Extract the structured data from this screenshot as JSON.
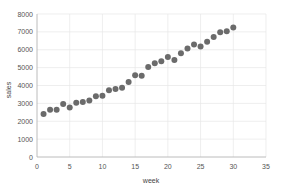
{
  "chart_data": {
    "type": "scatter",
    "title": "",
    "xlabel": "week",
    "ylabel": "sales",
    "xlim": [
      0,
      35
    ],
    "ylim": [
      0,
      8000
    ],
    "xticks": [
      0,
      5,
      10,
      15,
      20,
      25,
      30,
      35
    ],
    "yticks": [
      0,
      1000,
      2000,
      3000,
      4000,
      5000,
      6000,
      7000,
      8000
    ],
    "xtick_labels": [
      "0",
      "5",
      "10",
      "15",
      "20",
      "25",
      "30",
      "35"
    ],
    "ytick_labels": [
      "0",
      "1000",
      "2000",
      "3000",
      "4000",
      "5000",
      "6000",
      "7000",
      "8000"
    ],
    "grid": true,
    "grid_axis": "y",
    "legend": false,
    "marker_color": "#6b6b6b",
    "marker_size": 3.0,
    "background_color": "#ffffff",
    "x": [
      1,
      2,
      3,
      4,
      5,
      6,
      7,
      8,
      9,
      10,
      11,
      12,
      13,
      14,
      15,
      16,
      17,
      18,
      19,
      20,
      21,
      22,
      23,
      24,
      25,
      26,
      27,
      28,
      29,
      30
    ],
    "y": [
      2400,
      2650,
      2650,
      2960,
      2770,
      3030,
      3070,
      3160,
      3400,
      3430,
      3740,
      3800,
      3870,
      4200,
      4580,
      4550,
      5030,
      5250,
      5350,
      5600,
      5420,
      5800,
      6070,
      6300,
      6180,
      6450,
      6720,
      6980,
      7030,
      7250
    ],
    "series_name": "sales"
  },
  "axes": {
    "y_axis_title": "sales",
    "x_axis_title": "week"
  }
}
